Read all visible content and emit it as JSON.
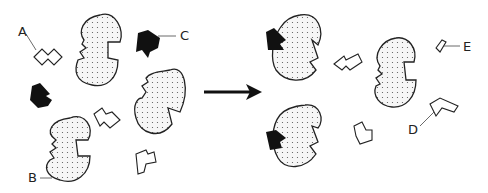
{
  "diagram": {
    "type": "enzyme-inhibition-process",
    "arrow": "right-arrow",
    "labels": {
      "A": "A",
      "B": "B",
      "C": "C",
      "D": "D",
      "E": "E"
    },
    "colors": {
      "stroke": "#222222",
      "enzyme_fill": "#f4f4f4",
      "inhibitor_fill": "#111111",
      "substrate_fill": "#ffffff"
    }
  }
}
